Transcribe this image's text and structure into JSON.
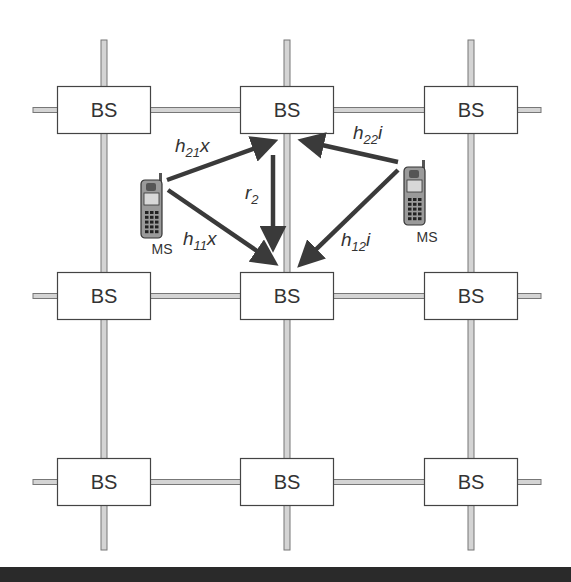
{
  "grid": {
    "rows": 3,
    "cols": 3,
    "base_station_label": "BS"
  },
  "base_stations": [
    {
      "row": 0,
      "col": 0,
      "label": "BS"
    },
    {
      "row": 0,
      "col": 1,
      "label": "BS"
    },
    {
      "row": 0,
      "col": 2,
      "label": "BS"
    },
    {
      "row": 1,
      "col": 0,
      "label": "BS"
    },
    {
      "row": 1,
      "col": 1,
      "label": "BS"
    },
    {
      "row": 1,
      "col": 2,
      "label": "BS"
    },
    {
      "row": 2,
      "col": 0,
      "label": "BS"
    },
    {
      "row": 2,
      "col": 1,
      "label": "BS"
    },
    {
      "row": 2,
      "col": 2,
      "label": "BS"
    }
  ],
  "mobile_stations": [
    {
      "id": "ms-left",
      "label": "MS"
    },
    {
      "id": "ms-right",
      "label": "MS"
    }
  ],
  "links": [
    {
      "id": "h21x",
      "from": "ms-left",
      "to": "bs-0-1",
      "base": "h",
      "sub": "21",
      "tail": "x"
    },
    {
      "id": "h11x",
      "from": "ms-left",
      "to": "bs-1-1",
      "base": "h",
      "sub": "11",
      "tail": "x"
    },
    {
      "id": "r2",
      "from": "bs-0-1",
      "to": "bs-1-1",
      "base": "r",
      "sub": "2",
      "tail": ""
    },
    {
      "id": "h22i",
      "from": "ms-right",
      "to": "bs-0-1",
      "base": "h",
      "sub": "22",
      "tail": "i"
    },
    {
      "id": "h12i",
      "from": "ms-right",
      "to": "bs-1-1",
      "base": "h",
      "sub": "12",
      "tail": "i"
    }
  ],
  "colors": {
    "arrow": "#3a3a3a",
    "box_stroke": "#444444",
    "wire_fill": "#d4d4d4",
    "wire_stroke": "#777777",
    "bottom_bar": "#2a2a2a"
  }
}
